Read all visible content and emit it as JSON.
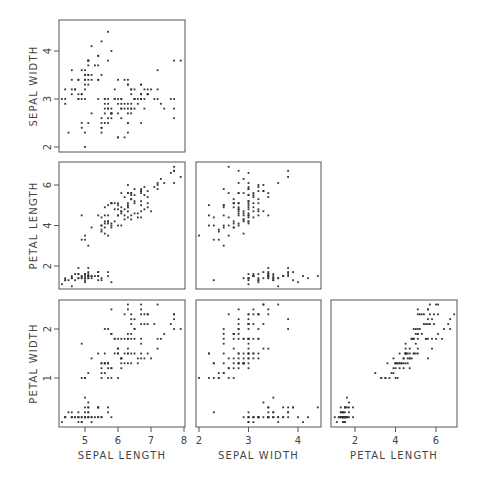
{
  "chart_data": {
    "type": "scatter",
    "title": "",
    "layout": "scatterplot-matrix (lower triangle)",
    "grid": false,
    "variables": [
      "SEPAL LENGTH",
      "SEPAL WIDTH",
      "PETAL LENGTH",
      "PETAL WIDTH"
    ],
    "axes": {
      "sepal_length": {
        "label": "SEPAL LENGTH",
        "ticks": [
          5,
          6,
          7,
          8
        ],
        "range": [
          4.2,
          8.0
        ]
      },
      "sepal_width": {
        "label": "SEPAL WIDTH",
        "ticks": [
          2,
          3,
          4
        ],
        "range": [
          1.9,
          4.6
        ]
      },
      "petal_length": {
        "label": "PETAL LENGTH",
        "ticks": [
          2,
          4,
          6
        ],
        "range": [
          0.8,
          7.1
        ]
      },
      "petal_width": {
        "label": "PETAL WIDTH",
        "ticks": [
          1,
          2
        ],
        "range": [
          0.0,
          2.6
        ]
      }
    },
    "panels": [
      {
        "x": "sepal_length",
        "y": "sepal_width"
      },
      {
        "x": "sepal_length",
        "y": "petal_length"
      },
      {
        "x": "sepal_width",
        "y": "petal_length"
      },
      {
        "x": "sepal_length",
        "y": "petal_width"
      },
      {
        "x": "sepal_width",
        "y": "petal_width"
      },
      {
        "x": "petal_length",
        "y": "petal_width"
      }
    ],
    "points": [
      [
        5.1,
        3.5,
        1.4,
        0.2
      ],
      [
        4.9,
        3.0,
        1.4,
        0.2
      ],
      [
        4.7,
        3.2,
        1.3,
        0.2
      ],
      [
        4.6,
        3.1,
        1.5,
        0.2
      ],
      [
        5.0,
        3.6,
        1.4,
        0.2
      ],
      [
        5.4,
        3.9,
        1.7,
        0.4
      ],
      [
        4.6,
        3.4,
        1.4,
        0.3
      ],
      [
        5.0,
        3.4,
        1.5,
        0.2
      ],
      [
        4.4,
        2.9,
        1.4,
        0.2
      ],
      [
        4.9,
        3.1,
        1.5,
        0.1
      ],
      [
        5.4,
        3.7,
        1.5,
        0.2
      ],
      [
        4.8,
        3.4,
        1.6,
        0.2
      ],
      [
        4.8,
        3.0,
        1.4,
        0.1
      ],
      [
        4.3,
        3.0,
        1.1,
        0.1
      ],
      [
        5.8,
        4.0,
        1.2,
        0.2
      ],
      [
        5.7,
        4.4,
        1.5,
        0.4
      ],
      [
        5.4,
        3.9,
        1.3,
        0.4
      ],
      [
        5.1,
        3.5,
        1.4,
        0.3
      ],
      [
        5.7,
        3.8,
        1.7,
        0.3
      ],
      [
        5.1,
        3.8,
        1.5,
        0.3
      ],
      [
        5.4,
        3.4,
        1.7,
        0.2
      ],
      [
        5.1,
        3.7,
        1.5,
        0.4
      ],
      [
        4.6,
        3.6,
        1.0,
        0.2
      ],
      [
        5.1,
        3.3,
        1.7,
        0.5
      ],
      [
        4.8,
        3.4,
        1.9,
        0.2
      ],
      [
        5.0,
        3.0,
        1.6,
        0.2
      ],
      [
        5.0,
        3.4,
        1.6,
        0.4
      ],
      [
        5.2,
        3.5,
        1.5,
        0.2
      ],
      [
        5.2,
        3.4,
        1.4,
        0.2
      ],
      [
        4.7,
        3.2,
        1.6,
        0.2
      ],
      [
        4.8,
        3.1,
        1.6,
        0.2
      ],
      [
        5.4,
        3.4,
        1.5,
        0.4
      ],
      [
        5.2,
        4.1,
        1.5,
        0.1
      ],
      [
        5.5,
        4.2,
        1.4,
        0.2
      ],
      [
        4.9,
        3.1,
        1.5,
        0.2
      ],
      [
        5.0,
        3.2,
        1.2,
        0.2
      ],
      [
        5.5,
        3.5,
        1.3,
        0.2
      ],
      [
        4.9,
        3.6,
        1.4,
        0.1
      ],
      [
        4.4,
        3.0,
        1.3,
        0.2
      ],
      [
        5.1,
        3.4,
        1.5,
        0.2
      ],
      [
        5.0,
        3.5,
        1.3,
        0.3
      ],
      [
        4.5,
        2.3,
        1.3,
        0.3
      ],
      [
        4.4,
        3.2,
        1.3,
        0.2
      ],
      [
        5.0,
        3.5,
        1.6,
        0.6
      ],
      [
        5.1,
        3.8,
        1.9,
        0.4
      ],
      [
        4.8,
        3.0,
        1.4,
        0.3
      ],
      [
        5.1,
        3.8,
        1.6,
        0.2
      ],
      [
        4.6,
        3.2,
        1.4,
        0.2
      ],
      [
        5.3,
        3.7,
        1.5,
        0.2
      ],
      [
        5.0,
        3.3,
        1.4,
        0.2
      ],
      [
        7.0,
        3.2,
        4.7,
        1.4
      ],
      [
        6.4,
        3.2,
        4.5,
        1.5
      ],
      [
        6.9,
        3.1,
        4.9,
        1.5
      ],
      [
        5.5,
        2.3,
        4.0,
        1.3
      ],
      [
        6.5,
        2.8,
        4.6,
        1.5
      ],
      [
        5.7,
        2.8,
        4.5,
        1.3
      ],
      [
        6.3,
        3.3,
        4.7,
        1.6
      ],
      [
        4.9,
        2.4,
        3.3,
        1.0
      ],
      [
        6.6,
        2.9,
        4.6,
        1.3
      ],
      [
        5.2,
        2.7,
        3.9,
        1.4
      ],
      [
        5.0,
        2.0,
        3.5,
        1.0
      ],
      [
        5.9,
        3.0,
        4.2,
        1.5
      ],
      [
        6.0,
        2.2,
        4.0,
        1.0
      ],
      [
        6.1,
        2.9,
        4.7,
        1.4
      ],
      [
        5.6,
        2.9,
        3.6,
        1.3
      ],
      [
        6.7,
        3.1,
        4.4,
        1.4
      ],
      [
        5.6,
        3.0,
        4.5,
        1.5
      ],
      [
        5.8,
        2.7,
        4.1,
        1.0
      ],
      [
        6.2,
        2.2,
        4.5,
        1.5
      ],
      [
        5.6,
        2.5,
        3.9,
        1.1
      ],
      [
        5.9,
        3.2,
        4.8,
        1.8
      ],
      [
        6.1,
        2.8,
        4.0,
        1.3
      ],
      [
        6.3,
        2.5,
        4.9,
        1.5
      ],
      [
        6.1,
        2.8,
        4.7,
        1.2
      ],
      [
        6.4,
        2.9,
        4.3,
        1.3
      ],
      [
        6.6,
        3.0,
        4.4,
        1.4
      ],
      [
        6.8,
        2.8,
        4.8,
        1.4
      ],
      [
        6.7,
        3.0,
        5.0,
        1.7
      ],
      [
        6.0,
        2.9,
        4.5,
        1.5
      ],
      [
        5.7,
        2.6,
        3.5,
        1.0
      ],
      [
        5.5,
        2.4,
        3.8,
        1.1
      ],
      [
        5.5,
        2.4,
        3.7,
        1.0
      ],
      [
        5.8,
        2.7,
        3.9,
        1.2
      ],
      [
        6.0,
        2.7,
        5.1,
        1.6
      ],
      [
        5.4,
        3.0,
        4.5,
        1.5
      ],
      [
        6.0,
        3.4,
        4.5,
        1.6
      ],
      [
        6.7,
        3.1,
        4.7,
        1.5
      ],
      [
        6.3,
        2.3,
        4.4,
        1.3
      ],
      [
        5.6,
        3.0,
        4.1,
        1.3
      ],
      [
        5.5,
        2.5,
        4.0,
        1.3
      ],
      [
        5.5,
        2.6,
        4.4,
        1.2
      ],
      [
        6.1,
        3.0,
        4.6,
        1.4
      ],
      [
        5.8,
        2.6,
        4.0,
        1.2
      ],
      [
        5.0,
        2.3,
        3.3,
        1.0
      ],
      [
        5.6,
        2.7,
        4.2,
        1.3
      ],
      [
        5.7,
        3.0,
        4.2,
        1.2
      ],
      [
        5.7,
        2.9,
        4.2,
        1.3
      ],
      [
        6.2,
        2.9,
        4.3,
        1.3
      ],
      [
        5.1,
        2.5,
        3.0,
        1.1
      ],
      [
        5.7,
        2.8,
        4.1,
        1.3
      ],
      [
        6.3,
        3.3,
        6.0,
        2.5
      ],
      [
        5.8,
        2.7,
        5.1,
        1.9
      ],
      [
        7.1,
        3.0,
        5.9,
        2.1
      ],
      [
        6.3,
        2.9,
        5.6,
        1.8
      ],
      [
        6.5,
        3.0,
        5.8,
        2.2
      ],
      [
        7.6,
        3.0,
        6.6,
        2.1
      ],
      [
        4.9,
        2.5,
        4.5,
        1.7
      ],
      [
        7.3,
        2.9,
        6.3,
        1.8
      ],
      [
        6.7,
        2.5,
        5.8,
        1.8
      ],
      [
        7.2,
        3.6,
        6.1,
        2.5
      ],
      [
        6.5,
        3.2,
        5.1,
        2.0
      ],
      [
        6.4,
        2.7,
        5.3,
        1.9
      ],
      [
        6.8,
        3.0,
        5.5,
        2.1
      ],
      [
        5.7,
        2.5,
        5.0,
        2.0
      ],
      [
        5.8,
        2.8,
        5.1,
        2.4
      ],
      [
        6.4,
        3.2,
        5.3,
        2.3
      ],
      [
        6.5,
        3.0,
        5.5,
        1.8
      ],
      [
        7.7,
        3.8,
        6.7,
        2.2
      ],
      [
        7.7,
        2.6,
        6.9,
        2.3
      ],
      [
        6.0,
        2.2,
        5.0,
        1.5
      ],
      [
        6.9,
        3.2,
        5.7,
        2.3
      ],
      [
        5.6,
        2.8,
        4.9,
        2.0
      ],
      [
        7.7,
        2.8,
        6.7,
        2.0
      ],
      [
        6.3,
        2.7,
        4.9,
        1.8
      ],
      [
        6.7,
        3.3,
        5.7,
        2.1
      ],
      [
        7.2,
        3.2,
        6.0,
        1.8
      ],
      [
        6.2,
        2.8,
        4.8,
        1.8
      ],
      [
        6.1,
        3.0,
        4.9,
        1.8
      ],
      [
        6.4,
        2.8,
        5.6,
        2.1
      ],
      [
        7.2,
        3.0,
        5.8,
        1.6
      ],
      [
        7.4,
        2.8,
        6.1,
        1.9
      ],
      [
        7.9,
        3.8,
        6.4,
        2.0
      ],
      [
        6.4,
        2.8,
        5.6,
        2.2
      ],
      [
        6.3,
        2.8,
        5.1,
        1.5
      ],
      [
        6.1,
        2.6,
        5.6,
        1.4
      ],
      [
        7.7,
        3.0,
        6.1,
        2.3
      ],
      [
        6.3,
        3.4,
        5.6,
        2.4
      ],
      [
        6.4,
        3.1,
        5.5,
        1.8
      ],
      [
        6.0,
        3.0,
        4.8,
        1.8
      ],
      [
        6.9,
        3.1,
        5.4,
        2.1
      ],
      [
        6.7,
        3.1,
        5.6,
        2.4
      ],
      [
        6.9,
        3.1,
        5.1,
        2.3
      ],
      [
        5.8,
        2.7,
        5.1,
        1.9
      ],
      [
        6.8,
        3.2,
        5.9,
        2.3
      ],
      [
        6.7,
        3.3,
        5.7,
        2.5
      ],
      [
        6.7,
        3.0,
        5.2,
        2.3
      ],
      [
        6.3,
        2.5,
        5.0,
        1.9
      ],
      [
        6.5,
        3.0,
        5.2,
        2.0
      ],
      [
        6.2,
        3.4,
        5.4,
        2.3
      ],
      [
        5.9,
        3.0,
        5.1,
        1.8
      ]
    ]
  },
  "geometry": {
    "columns": {
      "sepal_length": {
        "left": 59,
        "right": 185,
        "v0": 5,
        "p0": 85,
        "v1": 8,
        "p1": 184
      },
      "sepal_width": {
        "left": 196,
        "right": 321,
        "v0": 2,
        "p0": 199,
        "v1": 4,
        "p1": 298
      },
      "petal_length": {
        "left": 331,
        "right": 457,
        "v0": 2,
        "p0": 355,
        "v1": 6,
        "p1": 436
      }
    },
    "rows": {
      "sepal_width": {
        "top": 20,
        "bottom": 152,
        "v0": 2,
        "p0": 147,
        "v1": 4,
        "p1": 51
      },
      "petal_length": {
        "top": 162,
        "bottom": 289,
        "v0": 2,
        "p0": 266,
        "v1": 6,
        "p1": 185
      },
      "petal_width": {
        "top": 300,
        "bottom": 427,
        "v0": 1,
        "p0": 378,
        "v1": 2,
        "p1": 329
      }
    },
    "xlabel_y": 459,
    "ylabel_x": 33
  },
  "var_index": {
    "sepal_length": 0,
    "sepal_width": 1,
    "petal_length": 2,
    "petal_width": 3
  }
}
